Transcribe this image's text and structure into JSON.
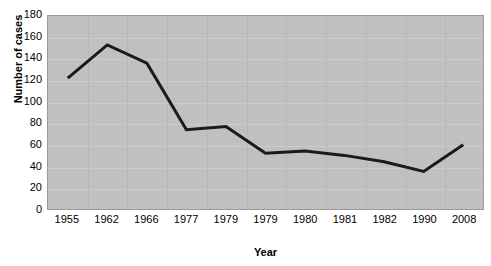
{
  "chart_data": {
    "type": "line",
    "title": "",
    "xlabel": "Year",
    "ylabel": "Number of cases",
    "categories": [
      "1955",
      "1962",
      "1966",
      "1977",
      "1979",
      "1979",
      "1980",
      "1981",
      "1982",
      "1990",
      "2008"
    ],
    "values": [
      122,
      153,
      136,
      74,
      77,
      52,
      54,
      50,
      44,
      35,
      60
    ],
    "series": [
      {
        "name": "Number of cases",
        "values": [
          122,
          153,
          136,
          74,
          77,
          52,
          54,
          50,
          44,
          35,
          60
        ]
      }
    ],
    "ylim": [
      0,
      180
    ],
    "yticks": [
      0,
      20,
      40,
      60,
      80,
      100,
      120,
      140,
      160,
      180
    ],
    "ytick_labels": [
      "0",
      "20",
      "40",
      "60",
      "80",
      "100",
      "120",
      "140",
      "160",
      "180"
    ],
    "grid": true,
    "grid_axis": "y",
    "legend": false,
    "legend_position": "none",
    "line_color": "#1a1a1a",
    "line_width": 3,
    "marker": "none",
    "plot_background": "#c0c0c0",
    "figure_background": "#ffffff",
    "gridline_color": "#cccccc",
    "axis_color": "#9a9a9a",
    "text_color": "#000000"
  }
}
